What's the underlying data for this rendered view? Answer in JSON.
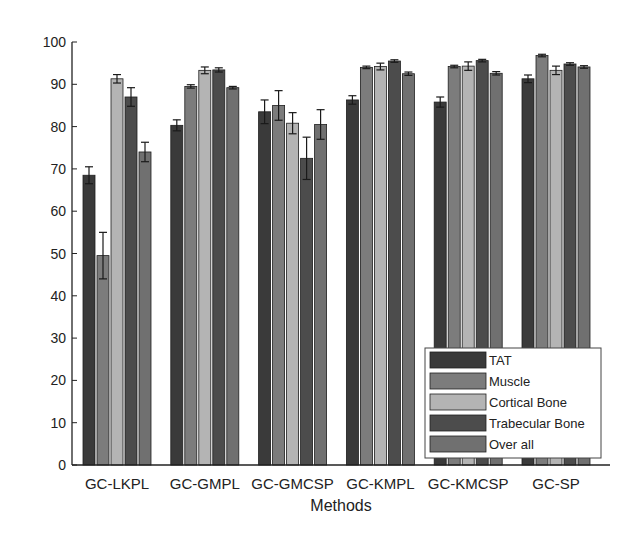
{
  "chart_data": {
    "type": "bar",
    "title": "",
    "xlabel": "Methods",
    "ylabel": "",
    "ylim": [
      0,
      100
    ],
    "yticks": [
      0,
      10,
      20,
      30,
      40,
      50,
      60,
      70,
      80,
      90,
      100
    ],
    "grid": false,
    "legend_position": "bottom-right",
    "categories": [
      "GC-LKPL",
      "GC-GMPL",
      "GC-GMCSP",
      "GC-KMPL",
      "GC-KMCSP",
      "GC-SP"
    ],
    "series": [
      {
        "name": "TAT",
        "color": "#3a3a3a",
        "values": [
          68.5,
          80.3,
          83.5,
          86.3,
          85.8,
          91.3
        ],
        "errors": [
          2.0,
          1.3,
          2.8,
          1.0,
          1.2,
          0.9
        ]
      },
      {
        "name": "Muscle",
        "color": "#7c7c7c",
        "values": [
          49.5,
          89.5,
          85.0,
          94.0,
          94.2,
          96.8
        ],
        "errors": [
          5.5,
          0.4,
          3.5,
          0.3,
          0.3,
          0.3
        ]
      },
      {
        "name": "Cortical Bone",
        "color": "#b4b4b4",
        "values": [
          91.3,
          93.3,
          80.8,
          94.2,
          94.3,
          93.3
        ],
        "errors": [
          1.0,
          0.8,
          2.5,
          0.8,
          1.0,
          1.0
        ]
      },
      {
        "name": "Trabecular Bone",
        "color": "#4c4c4c",
        "values": [
          87.0,
          93.4,
          72.5,
          95.5,
          95.6,
          94.8
        ],
        "errors": [
          2.2,
          0.5,
          5.0,
          0.3,
          0.3,
          0.3
        ]
      },
      {
        "name": "Over all",
        "color": "#707070",
        "values": [
          74.0,
          89.2,
          80.5,
          92.5,
          92.6,
          94.1
        ],
        "errors": [
          2.3,
          0.3,
          3.5,
          0.4,
          0.4,
          0.3
        ]
      }
    ]
  }
}
